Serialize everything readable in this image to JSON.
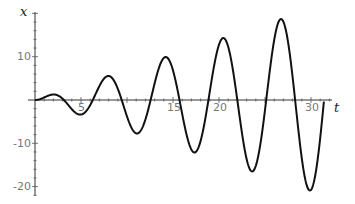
{
  "chart_data": {
    "type": "line",
    "title": "",
    "xlabel": "t",
    "ylabel": "x",
    "xlim": [
      0,
      32.5
    ],
    "ylim": [
      -22,
      21
    ],
    "x_ticks": [
      5,
      10,
      15,
      20,
      25,
      30
    ],
    "x_tick_labels": [
      "5",
      "",
      "15",
      "20",
      "",
      "30"
    ],
    "y_ticks": [
      10,
      -10,
      -20
    ],
    "y_tick_labels": [
      "10",
      "-10",
      "-20"
    ],
    "grid": false,
    "legend": null,
    "series": [
      {
        "name": "x(t) ≈ 0.7·t·sin(t)",
        "formula_approx": "0.7*t*sin(t)",
        "t_range": [
          0,
          31.4
        ],
        "key_points": [
          {
            "t": 0,
            "x": 0
          },
          {
            "t": 2.0,
            "x": 1.3
          },
          {
            "t": 4.9,
            "x": -3.4
          },
          {
            "t": 8.0,
            "x": 5.5
          },
          {
            "t": 11.1,
            "x": -7.8
          },
          {
            "t": 14.2,
            "x": 9.9
          },
          {
            "t": 17.3,
            "x": -12.1
          },
          {
            "t": 20.4,
            "x": 14.3
          },
          {
            "t": 23.6,
            "x": -16.5
          },
          {
            "t": 26.7,
            "x": 18.7
          },
          {
            "t": 29.9,
            "x": -20.9
          },
          {
            "t": 31.4,
            "x": 0
          }
        ]
      }
    ]
  },
  "labels": {
    "xlabel": "t",
    "ylabel": "x",
    "ticks": {
      "x5": "5",
      "x15": "15",
      "x20": "20",
      "x30": "30",
      "y10": "10",
      "ym10": "-10",
      "ym20": "-20"
    }
  }
}
